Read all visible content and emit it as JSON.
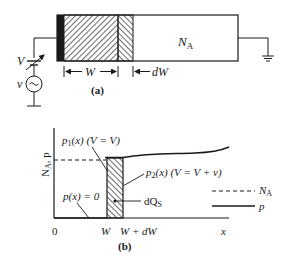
{
  "panel_a": {
    "label": "(a)",
    "source_dc_label": "V",
    "source_ac_label": "v",
    "region_label": "N",
    "region_label_sub": "A",
    "width_label": "W",
    "delta_width_label": "dW",
    "components": [
      "variable-dc-source",
      "ac-source",
      "metal-contact",
      "depletion-region",
      "incremental-depletion",
      "bulk-semiconductor",
      "ground"
    ]
  },
  "panel_b": {
    "label": "(b)",
    "y_axis_label": "N",
    "y_axis_label_sub": "A",
    "y_axis_label_suffix": ", p",
    "x_axis_label": "x",
    "x_ticks": [
      {
        "text": "0"
      },
      {
        "text": "W"
      },
      {
        "text": "W + dW"
      }
    ],
    "annotations": {
      "p1": {
        "main": "p",
        "sub": "1",
        "rest": "(x) (V = V)"
      },
      "p2": {
        "main": "p",
        "sub": "2",
        "rest": "(x) (V = V + v)"
      },
      "p_zero": "p(x) = 0",
      "dQs": {
        "main": "dQ",
        "sub": "S"
      }
    },
    "legend": [
      {
        "style": "dashed",
        "label": "N",
        "label_sub": "A"
      },
      {
        "style": "solid",
        "label": "p",
        "label_sub": ""
      }
    ]
  }
}
